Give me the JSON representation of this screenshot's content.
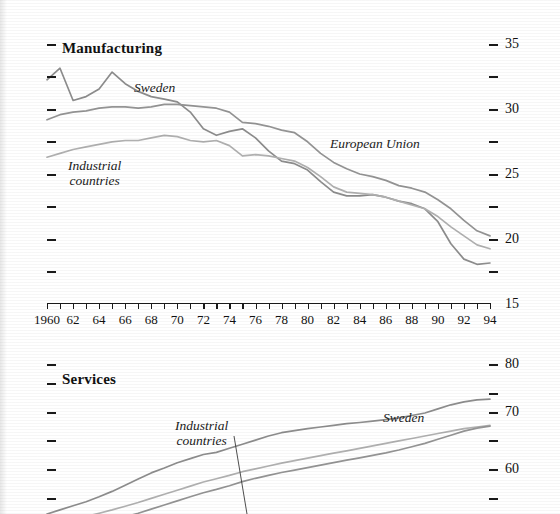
{
  "figure": {
    "background_color": "#ffffff",
    "line_color_sweden": "#8d8d8d",
    "line_color_eu": "#949494",
    "line_color_industrial": "#b0b0b0",
    "axis_color": "#1a1a1a"
  },
  "panels": [
    {
      "id": "manufacturing",
      "title": "Manufacturing",
      "x_axis": {
        "label": "",
        "ticks_every": 1,
        "labels_every": 2,
        "tick_labels": [
          "1960",
          "62",
          "64",
          "66",
          "68",
          "70",
          "72",
          "74",
          "76",
          "78",
          "80",
          "82",
          "84",
          "86",
          "88",
          "90",
          "92",
          "94"
        ],
        "range": [
          1960,
          1994
        ]
      },
      "y_axis": {
        "label": "",
        "range": [
          15,
          35
        ],
        "major_labels": [
          "35",
          "30",
          "25",
          "20",
          "15"
        ],
        "major_values": [
          35,
          30,
          25,
          20,
          15
        ],
        "minor_values": [
          32.5,
          27.5,
          22.5,
          17.5
        ]
      },
      "series_labels": [
        {
          "name": "Sweden",
          "text": "Sweden"
        },
        {
          "name": "European Union",
          "text": "European Union"
        },
        {
          "name": "Industrial countries",
          "line1": "Industrial",
          "line2": "countries"
        }
      ]
    },
    {
      "id": "services",
      "title": "Services",
      "y_axis": {
        "label": "",
        "major_labels": [
          "80",
          "70",
          "60"
        ],
        "major_values": [
          80,
          70,
          60
        ],
        "minor_values": [
          75,
          65,
          55
        ]
      },
      "series_labels": [
        {
          "name": "Sweden",
          "text": "Sweden"
        },
        {
          "name": "Industrial countries",
          "line1": "Industrial",
          "line2": "countries"
        }
      ]
    }
  ],
  "chart_data": [
    {
      "type": "line",
      "title": "Manufacturing",
      "xlabel": "",
      "ylabel": "",
      "xlim": [
        1960,
        1994
      ],
      "ylim": [
        15,
        35
      ],
      "grid": false,
      "legend_position": "inline-annotations",
      "x": [
        1960,
        1961,
        1962,
        1963,
        1964,
        1965,
        1966,
        1967,
        1968,
        1969,
        1970,
        1971,
        1972,
        1973,
        1974,
        1975,
        1976,
        1977,
        1978,
        1979,
        1980,
        1981,
        1982,
        1983,
        1984,
        1985,
        1986,
        1987,
        1988,
        1989,
        1990,
        1991,
        1992,
        1993,
        1994
      ],
      "series": [
        {
          "name": "Sweden",
          "color": "#8d8d8d",
          "values": [
            32.3,
            33.2,
            30.7,
            31.0,
            31.6,
            32.9,
            32.0,
            31.4,
            31.0,
            30.8,
            30.6,
            29.8,
            28.5,
            28.0,
            28.3,
            28.5,
            27.8,
            26.8,
            26.0,
            25.8,
            25.3,
            24.4,
            23.6,
            23.3,
            23.3,
            23.4,
            23.2,
            22.9,
            22.7,
            22.3,
            21.3,
            19.6,
            18.4,
            18.0,
            18.1
          ]
        },
        {
          "name": "European Union",
          "color": "#949494",
          "values": [
            29.2,
            29.6,
            29.8,
            29.9,
            30.1,
            30.2,
            30.2,
            30.1,
            30.2,
            30.4,
            30.4,
            30.3,
            30.2,
            30.1,
            29.8,
            29.0,
            28.9,
            28.7,
            28.4,
            28.2,
            27.5,
            26.6,
            25.9,
            25.4,
            25.0,
            24.8,
            24.5,
            24.1,
            23.9,
            23.6,
            23.0,
            22.3,
            21.4,
            20.6,
            20.2
          ]
        },
        {
          "name": "Industrial countries",
          "color": "#b0b0b0",
          "values": [
            26.3,
            26.6,
            26.9,
            27.1,
            27.3,
            27.5,
            27.6,
            27.6,
            27.8,
            28.0,
            27.9,
            27.6,
            27.5,
            27.6,
            27.2,
            26.4,
            26.5,
            26.4,
            26.2,
            26.0,
            25.5,
            24.8,
            24.0,
            23.6,
            23.5,
            23.4,
            23.2,
            22.9,
            22.6,
            22.3,
            21.7,
            20.9,
            20.2,
            19.5,
            19.2
          ]
        }
      ]
    },
    {
      "type": "line",
      "title": "Services",
      "xlabel": "",
      "ylabel": "",
      "xlim": [
        1960,
        1994
      ],
      "ylim": [
        50,
        82
      ],
      "grid": false,
      "legend_position": "inline-annotations",
      "note": "panel is cropped at the bottom edge of the image; only values above approx. 52 are visible",
      "x": [
        1960,
        1961,
        1962,
        1963,
        1964,
        1965,
        1966,
        1967,
        1968,
        1969,
        1970,
        1971,
        1972,
        1973,
        1974,
        1975,
        1976,
        1977,
        1978,
        1979,
        1980,
        1981,
        1982,
        1983,
        1984,
        1985,
        1986,
        1987,
        1988,
        1989,
        1990,
        1991,
        1992,
        1993,
        1994
      ],
      "series": [
        {
          "name": "Sweden",
          "color": "#8d8d8d",
          "values": [
            44.0,
            45.0,
            46.0,
            47.0,
            48.2,
            49.5,
            51.0,
            52.5,
            54.0,
            55.2,
            56.5,
            57.5,
            58.5,
            59.0,
            60.0,
            61.0,
            62.0,
            63.0,
            63.8,
            64.3,
            64.8,
            65.2,
            65.6,
            66.0,
            66.3,
            66.6,
            67.0,
            67.4,
            68.0,
            68.6,
            69.6,
            70.6,
            71.3,
            71.8,
            72.0
          ]
        },
        {
          "name": "Industrial countries",
          "color": "#b0b0b0",
          "values": [
            41.0,
            41.8,
            42.6,
            43.4,
            44.2,
            45.0,
            45.9,
            46.8,
            47.8,
            48.8,
            49.8,
            50.8,
            51.8,
            52.6,
            53.4,
            54.3,
            55.0,
            55.7,
            56.4,
            57.0,
            57.6,
            58.2,
            58.8,
            59.4,
            60.0,
            60.6,
            61.2,
            61.8,
            62.4,
            63.0,
            63.6,
            64.2,
            64.8,
            65.2,
            65.6
          ]
        },
        {
          "name": "European Union",
          "color": "#949494",
          "values": [
            38.5,
            39.2,
            40.0,
            40.8,
            41.6,
            42.4,
            43.3,
            44.2,
            45.2,
            46.2,
            47.2,
            48.2,
            49.2,
            50.0,
            50.9,
            51.9,
            52.7,
            53.4,
            54.1,
            54.7,
            55.3,
            55.9,
            56.5,
            57.1,
            57.7,
            58.3,
            58.9,
            59.6,
            60.4,
            61.2,
            62.2,
            63.2,
            64.2,
            64.9,
            65.4
          ]
        }
      ]
    }
  ]
}
